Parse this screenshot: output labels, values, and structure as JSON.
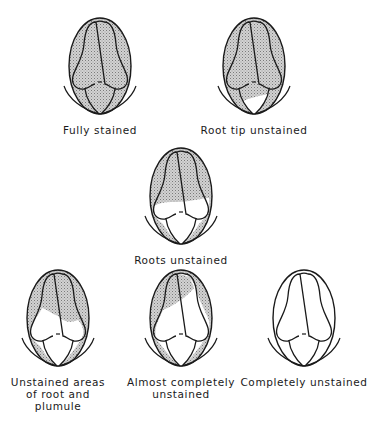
{
  "figure": {
    "colors": {
      "stained_fill": "#c8c8c8",
      "stipple": "#8a8a8a",
      "outline": "#1a1a1a",
      "unstained_fill": "#ffffff"
    },
    "panels": [
      {
        "id": "fully-stained",
        "lines": [
          "Fully stained"
        ],
        "x": 100,
        "y": 18,
        "unstained": "none"
      },
      {
        "id": "root-tip-unstained",
        "lines": [
          "Root tip unstained"
        ],
        "x": 254,
        "y": 18,
        "unstained": "root-tip"
      },
      {
        "id": "roots-unstained",
        "lines": [
          "Roots unstained"
        ],
        "x": 181,
        "y": 148,
        "unstained": "roots"
      },
      {
        "id": "unstained-areas-root-plumule",
        "lines": [
          "Unstained areas",
          "of root and",
          "plumule"
        ],
        "x": 58,
        "y": 270,
        "unstained": "root-and-plumule"
      },
      {
        "id": "almost-completely-unstained",
        "lines": [
          "Almost completely",
          "unstained"
        ],
        "x": 181,
        "y": 270,
        "unstained": "almost-all"
      },
      {
        "id": "completely-unstained",
        "lines": [
          "Completely unstained"
        ],
        "x": 304,
        "y": 270,
        "unstained": "all"
      }
    ]
  }
}
